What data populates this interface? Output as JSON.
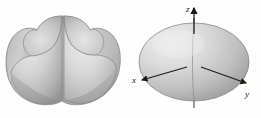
{
  "figure_panel": {
    "caption": "",
    "background_color": "#fefefe",
    "figures": [
      {
        "id": "left-surface",
        "name": "four-lobed-surface",
        "description": "Four-lobed rounded surface (cube-like blob) rendered in grayscale with no axes",
        "axes_shown": false,
        "shading": {
          "highlight_color": "#e8e8e8",
          "mid_color": "#c6c6c6",
          "shadow_color": "#8e8e8e",
          "outline_color": "#7d7d7d"
        }
      },
      {
        "id": "right-surface",
        "name": "oblate-ellipsoid-surface",
        "description": "Oblate ellipsoid (flattened sphere) rendered in grayscale with labeled coordinate axes",
        "axes_shown": true,
        "shading": {
          "highlight_color": "#eaeaea",
          "mid_color": "#c3c3c3",
          "shadow_color": "#909090",
          "outline_color": "#7d7d7d"
        },
        "axes": [
          {
            "key": "z",
            "label": "z",
            "direction": "up",
            "label_x": 189,
            "label_y": 9,
            "arrow_color": "#1a1a1a"
          },
          {
            "key": "x",
            "label": "x",
            "direction": "down-left",
            "label_x": 6,
            "label_y": 80,
            "arrow_color": "#1a1a1a"
          },
          {
            "key": "y",
            "label": "y",
            "direction": "down-right",
            "label_x": 117,
            "label_y": 95,
            "arrow_color": "#1a1a1a"
          }
        ]
      }
    ]
  }
}
